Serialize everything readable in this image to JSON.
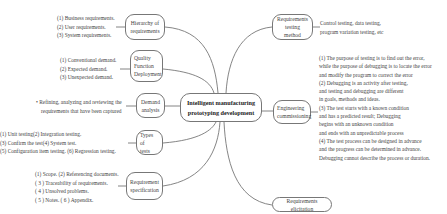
{
  "center": {
    "line1": "Intelligent manufacturing",
    "line2": "prototyping development"
  },
  "left_branches": [
    {
      "id": "hierarchy",
      "label_lines": [
        "Hierarchy of",
        "requirements"
      ],
      "details": [
        "(1) Business requirements.",
        "(2) User requirements.",
        "(3) System requirements."
      ]
    },
    {
      "id": "qfd",
      "label_lines": [
        "Quality",
        "Function",
        "Deployment"
      ],
      "details": [
        "(1) Conventional demand.",
        "(2) Expected demand.",
        "(3) Unexpected demand."
      ]
    },
    {
      "id": "demand-analysis",
      "label_lines": [
        "Demand",
        "analysis"
      ],
      "details": [
        "• Refining, analyzing and reviewing the",
        "requirements that have been captured"
      ]
    },
    {
      "id": "types-of-tests",
      "label_lines": [
        "Types of",
        "tests"
      ],
      "details": [
        "(1) Unit testing(2) Integration testing.",
        "(3) Confirm the test(4) System test.",
        "(5) Configuration item testing. (6) Regression testing."
      ]
    },
    {
      "id": "requirement-specification",
      "label_lines": [
        "Requirement",
        "specification"
      ],
      "details": [
        "(1) Scope. (2) Referencing documents.",
        "( 3 ) Traceability of requirements.",
        "( 4 ) Unsolved problems.",
        "( 5 ) Notes. ( 6 ) Appendix."
      ]
    }
  ],
  "right_branches": [
    {
      "id": "testing-method",
      "label_lines": [
        "Requirements",
        "testing method"
      ],
      "details": [
        "Control testing, data testing,",
        "program variation testing, etc"
      ]
    },
    {
      "id": "engineering-commissioning",
      "label_lines": [
        "Engineering",
        "commissioning"
      ],
      "details": [
        "(1) The purpose of testing is to find out the error,",
        "while the purpose of debugging is to locate the error",
        "and modify the program to correct the error",
        "(2) Debugging is an activity after testing,",
        "and testing and debugging are different",
        " in goals, methods and ideas.",
        "(3) The test starts with a known condition",
        "and has a predicted result; Debugging",
        "begins with an unknown condition",
        "and ends with an unpredictable process",
        "(4) The test process can be designed in advance",
        " and the progress can be determined in advance.",
        "Debugging cannot describe the process or duration."
      ]
    },
    {
      "id": "requirements-elicitation",
      "label_lines": [
        "Requirements elicitation"
      ],
      "details": []
    }
  ],
  "colors": {
    "line": "#777777",
    "text": "#444444",
    "background": "#ffffff"
  }
}
